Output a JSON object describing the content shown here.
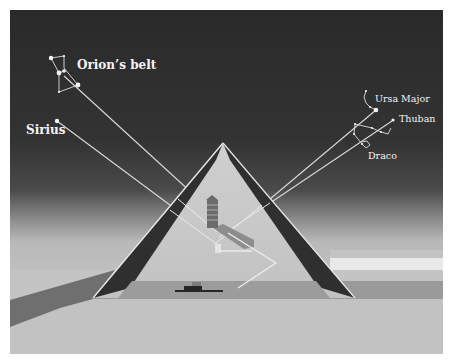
{
  "diagram": {
    "colors": {
      "sky_top": "#2b2b2b",
      "sky_bottom": "#5a5a5a",
      "haze": "#bdbdbd",
      "sand": "#c4c4c4",
      "sand_far": "#b2b2b2",
      "ground_band": "#8f8f8f",
      "pyramid_face": "#c9c9c9",
      "pyramid_dark_face": "#2e2e2e",
      "pyramid_edge": "#e6e6e6",
      "shadow": "#6a6a6a",
      "sight_line": "#d8d8d8",
      "star": "#f2f2f2"
    },
    "labels": {
      "orion": "Orion’s belt",
      "sirius": "Sirius",
      "ursa_major": "Ursa Major",
      "thuban": "Thuban",
      "draco": "Draco"
    },
    "features": [
      "king-chamber",
      "queen-chamber",
      "grand-gallery",
      "subterranean-chamber",
      "descending-passage",
      "ascending-passage"
    ]
  }
}
